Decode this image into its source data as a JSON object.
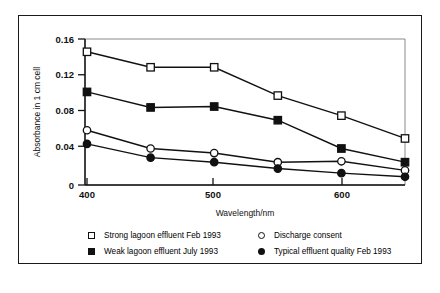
{
  "chart_data": {
    "type": "line",
    "title": "",
    "xlabel": "Wavelength/nm",
    "ylabel": "Absorbance in 1 cm cell",
    "x": [
      400,
      450,
      500,
      550,
      600,
      650
    ],
    "xlim": [
      390,
      655
    ],
    "ylim": [
      0,
      0.16
    ],
    "xticks": [
      400,
      500,
      600
    ],
    "xtick_labels": [
      "400",
      "500",
      "600"
    ],
    "yticks": [
      0,
      0.04,
      0.08,
      0.12,
      0.16
    ],
    "ytick_labels": [
      "0",
      "0.04",
      "0.08",
      "0.12",
      "0.16"
    ],
    "grid": false,
    "legend_position": "below",
    "series": [
      {
        "name": "Strong lagoon effluent Feb 1993",
        "marker": "open-square",
        "color": "#111111",
        "values": [
          0.146,
          0.129,
          0.129,
          0.098,
          0.076,
          0.051
        ]
      },
      {
        "name": "Weak lagoon effluent July 1993",
        "marker": "filled-square",
        "color": "#111111",
        "values": [
          0.102,
          0.085,
          0.086,
          0.071,
          0.04,
          0.025
        ]
      },
      {
        "name": "Discharge consent",
        "marker": "open-circle",
        "color": "#111111",
        "values": [
          0.06,
          0.04,
          0.035,
          0.025,
          0.026,
          0.016
        ]
      },
      {
        "name": "Typical effluent quality Feb 1993",
        "marker": "filled-circle",
        "color": "#111111",
        "values": [
          0.045,
          0.03,
          0.025,
          0.018,
          0.013,
          0.009
        ]
      }
    ]
  },
  "legend": {
    "entries": [
      {
        "label": "Strong lagoon effluent Feb 1993",
        "marker": "open-square"
      },
      {
        "label": "Discharge consent",
        "marker": "open-circle"
      },
      {
        "label": "Weak lagoon effluent July 1993",
        "marker": "filled-square"
      },
      {
        "label": "Typical effluent quality Feb 1993",
        "marker": "filled-circle"
      }
    ]
  },
  "style": {
    "line_color": "#111111",
    "frame_color": "#1a1a1a",
    "plot_frame_color": "#8a8a8a",
    "background": "#ffffff"
  }
}
